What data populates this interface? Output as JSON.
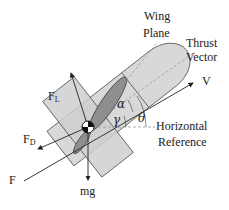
{
  "labels": {
    "wing_plane_1": "Wing",
    "wing_plane_2": "Plane",
    "thrust_vector_1": "Thrust",
    "thrust_vector_2": "Vector",
    "velocity": "V",
    "lift": "F",
    "lift_sub": "L",
    "drag": "F",
    "drag_sub": "D",
    "thrust_force": "F",
    "weight": "mg",
    "alpha": "α",
    "gamma": "γ",
    "theta": "θ",
    "horizontal_reference_1": "Horizontal",
    "horizontal_reference_2": "Reference"
  },
  "colors": {
    "fuselage_fill": "#d6d6d6",
    "wing_fill": "#c8c8c8",
    "propeller_fill": "#8a8a8a",
    "line": "#333333",
    "dashed": "#999999"
  }
}
